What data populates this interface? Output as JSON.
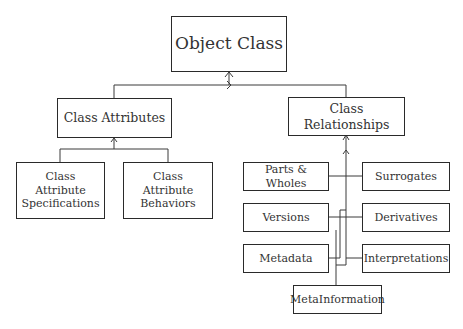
{
  "diagram": {
    "root": {
      "label": "Object Class"
    },
    "branches": [
      {
        "label": "Class Attributes",
        "children": [
          {
            "label": "Class Attribute Specifications"
          },
          {
            "label": "Class Attribute Behaviors"
          }
        ]
      },
      {
        "label": "Class Relationships",
        "children": [
          {
            "label": "Parts & Wholes"
          },
          {
            "label": "Surrogates"
          },
          {
            "label": "Versions"
          },
          {
            "label": "Derivatives"
          },
          {
            "label": "Metadata"
          },
          {
            "label": "Interpretations"
          },
          {
            "label": "MetaInformation"
          }
        ]
      }
    ],
    "colors": {
      "line": "#2a2a2a",
      "text": "#333333",
      "background": "#ffffff"
    }
  }
}
